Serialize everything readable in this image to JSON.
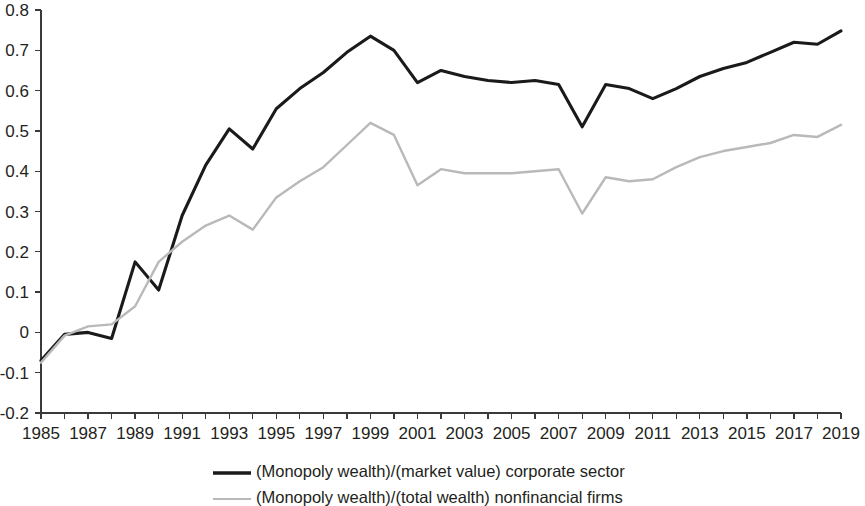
{
  "chart_data": {
    "type": "line",
    "title": "",
    "subtitle": "",
    "xlabel": "",
    "ylabel": "",
    "x": [
      1985,
      1986,
      1987,
      1988,
      1989,
      1990,
      1991,
      1992,
      1993,
      1994,
      1995,
      1996,
      1997,
      1998,
      1999,
      2000,
      2001,
      2002,
      2003,
      2004,
      2005,
      2006,
      2007,
      2008,
      2009,
      2010,
      2011,
      2012,
      2013,
      2014,
      2015,
      2016,
      2017,
      2018,
      2019
    ],
    "xlim": [
      1985,
      2019
    ],
    "ylim": [
      -0.2,
      0.8
    ],
    "ytick_values": [
      -0.2,
      -0.1,
      0,
      0.1,
      0.2,
      0.3,
      0.4,
      0.5,
      0.6,
      0.7,
      0.8
    ],
    "ytick_labels": [
      "-0.2",
      "-0.1",
      "0",
      "0.1",
      "0.2",
      "0.3",
      "0.4",
      "0.5",
      "0.6",
      "0.7",
      "0.8"
    ],
    "xtick_values": [
      1985,
      1986,
      1987,
      1988,
      1989,
      1990,
      1991,
      1992,
      1993,
      1994,
      1995,
      1996,
      1997,
      1998,
      1999,
      2000,
      2001,
      2002,
      2003,
      2004,
      2005,
      2006,
      2007,
      2008,
      2009,
      2010,
      2011,
      2012,
      2013,
      2014,
      2015,
      2016,
      2017,
      2018,
      2019
    ],
    "xtick_labels": [
      "1985",
      "",
      "1987",
      "",
      "1989",
      "",
      "1991",
      "",
      "1993",
      "",
      "1995",
      "",
      "1997",
      "",
      "1999",
      "",
      "2001",
      "",
      "2003",
      "",
      "2005",
      "",
      "2007",
      "",
      "2009",
      "",
      "2011",
      "",
      "2013",
      "",
      "2015",
      "",
      "2017",
      "",
      "2019"
    ],
    "grid": false,
    "legend_position": "bottom",
    "series": [
      {
        "name": "(Monopoly wealth)/(market value) corporate sector",
        "color": "#1a1a1a",
        "width": 3.1,
        "values": [
          -0.07,
          -0.005,
          0.0,
          -0.015,
          0.175,
          0.105,
          0.29,
          0.415,
          0.505,
          0.455,
          0.555,
          0.605,
          0.645,
          0.695,
          0.735,
          0.7,
          0.62,
          0.65,
          0.635,
          0.625,
          0.62,
          0.625,
          0.615,
          0.51,
          0.615,
          0.605,
          0.58,
          0.605,
          0.635,
          0.655,
          0.67,
          0.695,
          0.72,
          0.715,
          0.748
        ]
      },
      {
        "name": "(Monopoly wealth)/(total wealth) nonfinancial firms",
        "color": "#b9b9b9",
        "width": 2.4,
        "values": [
          -0.075,
          -0.008,
          0.015,
          0.02,
          0.065,
          0.175,
          0.225,
          0.265,
          0.29,
          0.255,
          0.335,
          0.375,
          0.41,
          0.465,
          0.52,
          0.49,
          0.365,
          0.405,
          0.395,
          0.395,
          0.395,
          0.4,
          0.405,
          0.295,
          0.385,
          0.375,
          0.38,
          0.41,
          0.435,
          0.45,
          0.46,
          0.47,
          0.49,
          0.485,
          0.515
        ]
      }
    ],
    "legend": [
      {
        "label": "(Monopoly wealth)/(market value) corporate sector",
        "color": "#1a1a1a",
        "width": 3.4
      },
      {
        "label": "(Monopoly wealth)/(total wealth) nonfinancial firms",
        "color": "#b9b9b9",
        "width": 2.2
      }
    ]
  }
}
